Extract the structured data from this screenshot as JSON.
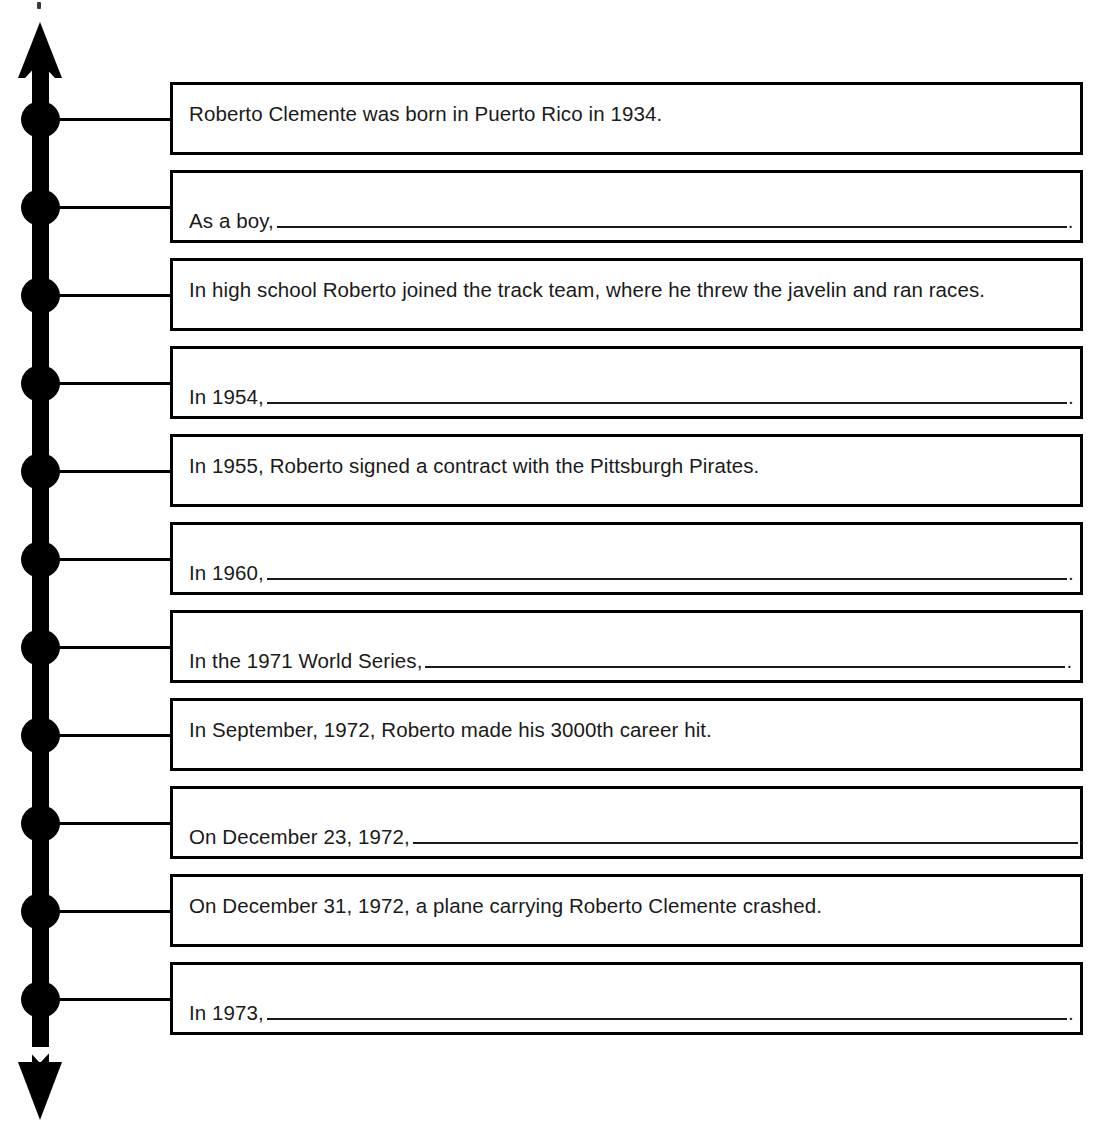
{
  "worksheet": {
    "subject": "Roberto Clemente",
    "axis": {
      "top_arrow": "arrow-up",
      "bottom_arrow": "arrow-down",
      "node_count": 11
    },
    "events": [
      {
        "index": 1,
        "type": "complete",
        "text": "Roberto Clemente was born in Puerto Rico in 1934.",
        "prompt": "",
        "blank_width_px": 0
      },
      {
        "index": 2,
        "type": "blank",
        "text": "",
        "prompt": "As a boy,",
        "blank_width_px": 790
      },
      {
        "index": 3,
        "type": "complete",
        "text": "In high school Roberto joined the track team, where he threw the javelin and ran races.",
        "prompt": "",
        "blank_width_px": 0
      },
      {
        "index": 4,
        "type": "blank",
        "text": "",
        "prompt": "In 1954,",
        "blank_width_px": 800
      },
      {
        "index": 5,
        "type": "complete",
        "text": "In 1955, Roberto signed a contract with the Pittsburgh Pirates.",
        "prompt": "",
        "blank_width_px": 0
      },
      {
        "index": 6,
        "type": "blank",
        "text": "",
        "prompt": "In 1960,",
        "blank_width_px": 800
      },
      {
        "index": 7,
        "type": "blank",
        "text": "",
        "prompt": "In the 1971 World Series,",
        "blank_width_px": 640
      },
      {
        "index": 8,
        "type": "complete",
        "text": "In September, 1972, Roberto made his 3000th career hit.",
        "prompt": "",
        "blank_width_px": 0
      },
      {
        "index": 9,
        "type": "blank",
        "text": "",
        "prompt": "On December 23, 1972,",
        "blank_width_px": 665
      },
      {
        "index": 10,
        "type": "complete",
        "text": "On December 31, 1972, a plane carrying Roberto Clemente crashed.",
        "prompt": "",
        "blank_width_px": 0
      },
      {
        "index": 11,
        "type": "blank",
        "text": "",
        "prompt": "In 1973,",
        "blank_width_px": 800
      }
    ],
    "blank_terminator": "."
  },
  "colors": {
    "ink": "#000000",
    "text": "#1a1a1a",
    "paper": "#ffffff"
  }
}
